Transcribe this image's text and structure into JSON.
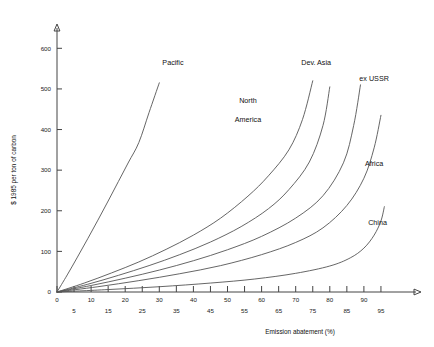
{
  "chart_data": {
    "type": "line",
    "title": "",
    "xlabel": "Emission abatement (%)",
    "ylabel": "$ 1985 per ton of carbon",
    "xlim": [
      0,
      100
    ],
    "ylim": [
      0,
      650
    ],
    "grid": false,
    "legend_position": "inline-curve-labels",
    "x_ticks_major": [
      0,
      10,
      20,
      30,
      40,
      50,
      60,
      70,
      80,
      90
    ],
    "x_ticks_minor": [
      5,
      15,
      25,
      35,
      45,
      55,
      65,
      75,
      85,
      95
    ],
    "y_ticks": [
      0,
      100,
      200,
      300,
      400,
      500,
      600
    ],
    "series": [
      {
        "name": "Pacific",
        "label": "Pacific",
        "label_lines": [
          "Pacific"
        ],
        "x": [
          0,
          3,
          6,
          9,
          12,
          15,
          18,
          21,
          24,
          27,
          30
        ],
        "values": [
          0,
          42,
          86,
          131,
          177,
          224,
          272,
          320,
          368,
          442,
          515
        ]
      },
      {
        "name": "North America",
        "label": "North America",
        "label_lines": [
          "North",
          "America"
        ],
        "x": [
          0,
          8,
          16,
          24,
          32,
          40,
          48,
          56,
          62,
          68,
          72,
          75
        ],
        "values": [
          0,
          22,
          47,
          74,
          105,
          140,
          182,
          236,
          286,
          350,
          425,
          520
        ]
      },
      {
        "name": "Dev. Asia",
        "label": "Dev. Asia",
        "label_lines": [
          "Dev. Asia"
        ],
        "x": [
          0,
          9,
          18,
          27,
          36,
          45,
          54,
          62,
          68,
          74,
          78,
          80
        ],
        "values": [
          0,
          19,
          41,
          65,
          92,
          123,
          161,
          205,
          252,
          320,
          410,
          505
        ]
      },
      {
        "name": "ex USSR",
        "label": "ex USSR",
        "label_lines": [
          "ex USSR"
        ],
        "x": [
          0,
          10,
          20,
          30,
          40,
          50,
          60,
          70,
          78,
          84,
          87,
          89
        ],
        "values": [
          0,
          16,
          34,
          54,
          77,
          104,
          137,
          182,
          237,
          318,
          410,
          510
        ]
      },
      {
        "name": "Africa",
        "label": "Africa",
        "label_lines": [
          "Africa"
        ],
        "x": [
          0,
          12,
          24,
          36,
          48,
          60,
          70,
          78,
          85,
          90,
          93,
          95
        ],
        "values": [
          0,
          13,
          28,
          45,
          65,
          92,
          122,
          158,
          213,
          280,
          355,
          435
        ]
      },
      {
        "name": "China",
        "label": "China",
        "label_lines": [
          "China"
        ],
        "x": [
          0,
          15,
          30,
          45,
          58,
          70,
          80,
          86,
          90,
          93,
          95,
          96
        ],
        "values": [
          0,
          6,
          13,
          22,
          32,
          46,
          64,
          84,
          108,
          140,
          175,
          210
        ]
      }
    ],
    "annotations": [
      {
        "text": "Pacific",
        "x": 34,
        "y": 560
      },
      {
        "text": "North",
        "x": 56,
        "y": 465
      },
      {
        "text": "America",
        "x": 56,
        "y": 418
      },
      {
        "text": "Dev. Asia",
        "x": 76,
        "y": 560
      },
      {
        "text": "ex USSR",
        "x": 93,
        "y": 520
      },
      {
        "text": "Africa",
        "x": 93,
        "y": 310
      },
      {
        "text": "China",
        "x": 94,
        "y": 165
      }
    ]
  }
}
